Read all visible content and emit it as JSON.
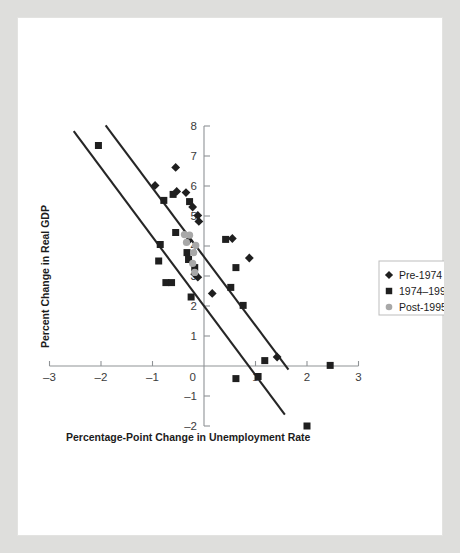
{
  "figure": {
    "background_color": "#dededc",
    "panel_color": "#ffffff"
  },
  "chart_data": {
    "type": "scatter",
    "title": "",
    "xlabel": "Percentage-Point Change in Unemployment Rate",
    "ylabel": "Percent Change in Real GDP",
    "xlim": [
      -3,
      3
    ],
    "ylim": [
      -2,
      8
    ],
    "xticks": [
      -3,
      -2,
      -1,
      0,
      1,
      2,
      3
    ],
    "xtick_labels": [
      "–3",
      "–2",
      "–1",
      "0",
      "1",
      "2",
      "3"
    ],
    "yticks": [
      -2,
      -1,
      0,
      1,
      2,
      3,
      4,
      5,
      6,
      7,
      8
    ],
    "ytick_labels": [
      "–2",
      "–1",
      "0",
      "1",
      "2",
      "3",
      "4",
      "5",
      "6",
      "7",
      "8"
    ],
    "grid": false,
    "legend_position": "right",
    "marker_colors": {
      "pre_1974": "#1f1f1f",
      "between_1974_1995": "#1f1f1f",
      "post_1995": "#a8a8a8"
    },
    "series": [
      {
        "name": "Pre-1974",
        "marker": "diamond",
        "color": "#1f1f1f",
        "points": [
          [
            -0.95,
            6.02
          ],
          [
            -0.55,
            6.62
          ],
          [
            -0.53,
            5.82
          ],
          [
            -0.35,
            5.78
          ],
          [
            -0.22,
            5.3
          ],
          [
            -0.12,
            5.02
          ],
          [
            -0.1,
            4.82
          ],
          [
            -0.3,
            4.18
          ],
          [
            -0.18,
            3.06
          ],
          [
            -0.12,
            2.96
          ],
          [
            0.55,
            4.25
          ],
          [
            0.88,
            3.6
          ],
          [
            0.16,
            2.42
          ],
          [
            1.42,
            0.3
          ]
        ]
      },
      {
        "name": "1974–1995",
        "marker": "square",
        "color": "#1f1f1f",
        "points": [
          [
            -2.05,
            7.35
          ],
          [
            -0.78,
            5.52
          ],
          [
            -0.6,
            5.72
          ],
          [
            -0.28,
            5.48
          ],
          [
            -0.55,
            4.45
          ],
          [
            -0.85,
            4.05
          ],
          [
            -0.88,
            3.5
          ],
          [
            -0.33,
            3.78
          ],
          [
            -0.3,
            3.55
          ],
          [
            -0.18,
            3.28
          ],
          [
            -0.74,
            2.78
          ],
          [
            -0.63,
            2.78
          ],
          [
            -0.25,
            2.3
          ],
          [
            0.42,
            4.22
          ],
          [
            0.62,
            3.28
          ],
          [
            0.52,
            2.62
          ],
          [
            0.76,
            2.02
          ],
          [
            1.18,
            0.18
          ],
          [
            1.05,
            -0.35
          ],
          [
            0.62,
            -0.42
          ],
          [
            2.0,
            -2.0
          ],
          [
            2.45,
            0.02
          ]
        ]
      },
      {
        "name": "Post-1995",
        "marker": "circle",
        "color": "#a8a8a8",
        "points": [
          [
            -0.38,
            4.38
          ],
          [
            -0.28,
            4.36
          ],
          [
            -0.34,
            4.12
          ],
          [
            -0.16,
            4.02
          ],
          [
            -0.2,
            3.78
          ],
          [
            -0.22,
            3.42
          ],
          [
            -0.18,
            3.12
          ]
        ]
      }
    ],
    "fit_lines": [
      {
        "name": "upper-fit-line",
        "x_start": -1.91,
        "y_start": 8.02,
        "x_end": 1.64,
        "y_end": -0.12
      },
      {
        "name": "lower-fit-line",
        "x_start": -2.53,
        "y_start": 7.83,
        "x_end": 1.57,
        "y_end": -1.62
      }
    ]
  },
  "legend": {
    "entries": [
      {
        "label": "Pre-1974",
        "marker": "diamond"
      },
      {
        "label": "1974–1995",
        "marker": "square"
      },
      {
        "label": "Post-1995",
        "marker": "circle"
      }
    ]
  }
}
